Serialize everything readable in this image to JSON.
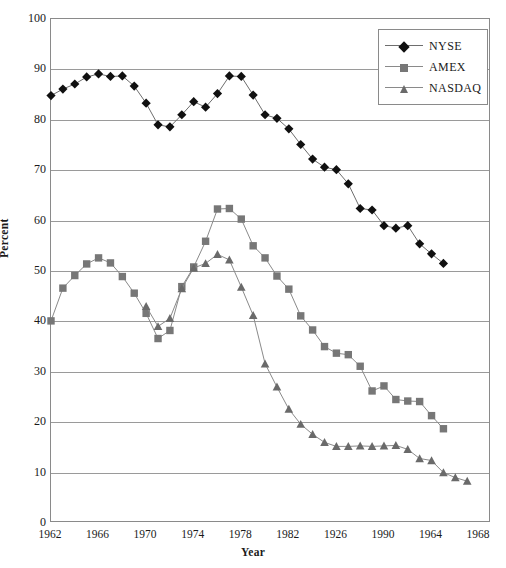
{
  "chart_data": {
    "type": "line",
    "title": "",
    "xlabel": "Year",
    "ylabel": "Percent",
    "ylim": [
      0,
      100
    ],
    "ytick_step": 10,
    "yticks": [
      "0",
      "10",
      "20",
      "30",
      "40",
      "50",
      "60",
      "70",
      "80",
      "90",
      "100"
    ],
    "grid": true,
    "grid_axis": "y",
    "legend_position": "top-right",
    "x_tick_labels": [
      "1962",
      "1966",
      "1970",
      "1974",
      "1978",
      "1982",
      "1926",
      "1990",
      "1964",
      "1968"
    ],
    "x_index_range": [
      0,
      37
    ],
    "x_tick_indices": [
      0,
      4,
      8,
      12,
      16,
      20,
      24,
      28,
      32,
      36
    ],
    "series": [
      {
        "name": "NYSE",
        "marker": "diamond",
        "color": "#101010",
        "line_color": "#6e6e6e",
        "start_index": 0,
        "values": [
          84.8,
          86.1,
          87.1,
          88.5,
          89.1,
          88.6,
          88.7,
          86.7,
          83.3,
          79.0,
          78.6,
          81.0,
          83.6,
          82.5,
          85.2,
          88.7,
          88.6,
          84.9,
          81.0,
          80.3,
          78.2,
          75.1,
          72.2,
          70.6,
          70.1,
          67.3,
          62.4,
          62.1,
          59.0,
          58.5,
          59.0,
          55.4,
          53.4,
          51.5
        ]
      },
      {
        "name": "AMEX",
        "marker": "square",
        "color": "#777777",
        "line_color": "#8a8a8a",
        "start_index": 0,
        "values": [
          40.1,
          46.6,
          49.1,
          51.4,
          52.6,
          51.6,
          48.9,
          45.6,
          41.6,
          36.6,
          38.2,
          46.9,
          50.8,
          55.9,
          62.3,
          62.4,
          60.3,
          55.0,
          52.6,
          49.0,
          46.4,
          41.1,
          38.3,
          35.0,
          33.7,
          33.4,
          31.1,
          26.2,
          27.2,
          24.5,
          24.2,
          24.1,
          21.3,
          18.7
        ]
      },
      {
        "name": "NASDAQ",
        "marker": "triangle",
        "color": "#6a6a6a",
        "line_color": "#8a8a8a",
        "start_index": 8,
        "values": [
          43.0,
          39.0,
          40.6,
          46.5,
          50.6,
          51.5,
          53.3,
          52.2,
          46.8,
          41.2,
          31.6,
          27.0,
          22.6,
          19.6,
          17.6,
          16.0,
          15.2,
          15.2,
          15.3,
          15.2,
          15.3,
          15.4,
          14.6,
          12.8,
          12.4,
          10.0,
          9.0,
          8.3
        ]
      }
    ]
  },
  "legend": {
    "entries": [
      {
        "label": "NYSE"
      },
      {
        "label": "AMEX"
      },
      {
        "label": "NASDAQ"
      }
    ]
  },
  "axis_titles": {
    "y": "Percent",
    "x": "Year"
  }
}
